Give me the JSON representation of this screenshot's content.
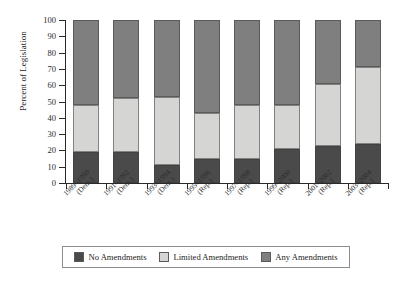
{
  "chart_data": {
    "type": "bar",
    "subtype": "stacked-bar-100",
    "title": "",
    "xlabel": "",
    "ylabel": "Percent of Legislation",
    "ylim": [
      0,
      100
    ],
    "ytick_step": 10,
    "yticks": [
      0,
      10,
      20,
      30,
      40,
      50,
      60,
      70,
      80,
      90,
      100
    ],
    "ytick_labels": [
      "0",
      "10",
      "20",
      "30",
      "40",
      "50",
      "60",
      "70",
      "80",
      "90",
      "100"
    ],
    "grid": false,
    "legend_position": "bottom",
    "categories": [
      "1989–1990 (Dem.)",
      "1991–1992 (Dem.)",
      "1993–1994 (Dem.)",
      "1995–1996 (Rep.)",
      "1997–1998 (Rep.)",
      "1999–2000 (Rep.)",
      "2001–2002 (Rep.)",
      "2003–2004 (Rep.)"
    ],
    "category_lines": [
      [
        "1989–1990",
        "(Dem.)"
      ],
      [
        "1991–1992",
        "(Dem.)"
      ],
      [
        "1993–1994",
        "(Dem.)"
      ],
      [
        "1995–1996",
        "(Rep.)"
      ],
      [
        "1997–1998",
        "(Rep.)"
      ],
      [
        "1999–2000",
        "(Rep.)"
      ],
      [
        "2001–2002",
        "(Rep.)"
      ],
      [
        "2003–2004",
        "(Rep.)"
      ]
    ],
    "series": [
      {
        "name": "No Amendments",
        "color": "#4a4a4a",
        "values": [
          19,
          19,
          11,
          15,
          15,
          21,
          23,
          24
        ]
      },
      {
        "name": "Limited Amendments",
        "color": "#d5d5d3",
        "values": [
          29,
          33,
          42,
          28,
          33,
          27,
          38,
          47
        ]
      },
      {
        "name": "Any Amendments",
        "color": "#807f7f",
        "values": [
          52,
          48,
          47,
          57,
          52,
          52,
          39,
          29
        ]
      }
    ],
    "cumulative_tops": [
      [
        19,
        48,
        100
      ],
      [
        19,
        52,
        100
      ],
      [
        11,
        53,
        100
      ],
      [
        15,
        43,
        100
      ],
      [
        15,
        48,
        100
      ],
      [
        21,
        48,
        100
      ],
      [
        23,
        61,
        100
      ],
      [
        24,
        71,
        100
      ]
    ]
  },
  "legend": {
    "items": [
      {
        "label": "No Amendments",
        "color": "#4a4a4a"
      },
      {
        "label": "Limited Amendments",
        "color": "#d5d5d3"
      },
      {
        "label": "Any Amendments",
        "color": "#807f7f"
      }
    ]
  },
  "colors": {
    "no_amendments": "#4a4a4a",
    "limited_amendments": "#d5d5d3",
    "any_amendments": "#807f7f",
    "axis": "#2a2a2a",
    "background": "#ffffff"
  }
}
